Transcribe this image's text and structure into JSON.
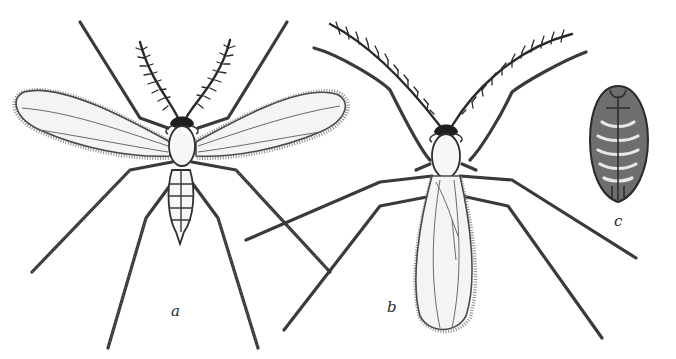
{
  "figure": {
    "background_color": "#ffffff",
    "ink_color": "#2a2a2a",
    "specimens": [
      {
        "label": "a",
        "description": "winged adult, wings spread, pectinate antennae, six long legs, segmented abdomen"
      },
      {
        "label": "b",
        "description": "adult with wings folded over body, long feathered antennae, six long legs"
      },
      {
        "label": "c",
        "description": "pupa, oval segmented body, dorsal view"
      }
    ]
  }
}
